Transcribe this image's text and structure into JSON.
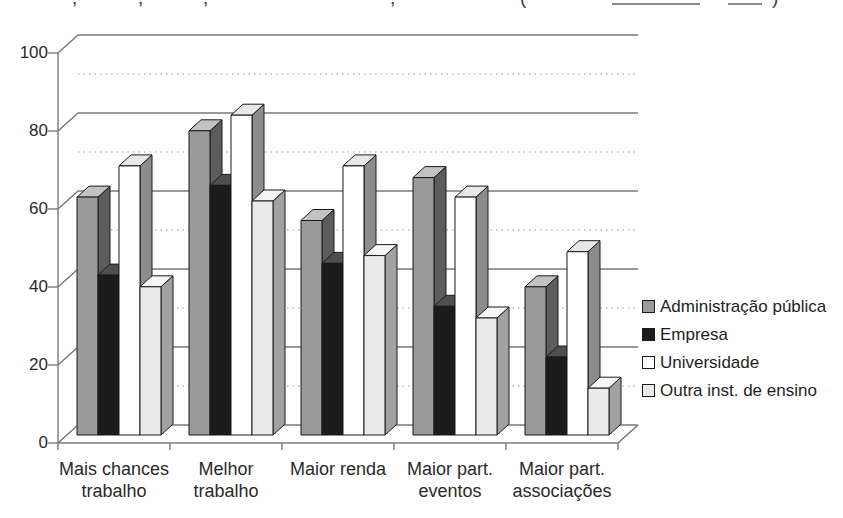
{
  "caption_fragments": {
    "glyphs": [
      {
        "x": 72,
        "ch": ","
      },
      {
        "x": 138,
        "ch": ","
      },
      {
        "x": 203,
        "ch": ","
      },
      {
        "x": 390,
        "ch": ","
      },
      {
        "x": 520,
        "ch": "("
      },
      {
        "x": 772,
        "ch": ")"
      }
    ],
    "rules": [
      {
        "x": 612,
        "w": 88
      },
      {
        "x": 728,
        "w": 34
      }
    ]
  },
  "chart_data": {
    "type": "bar",
    "style": "3d-clustered-column",
    "title": "",
    "xlabel": "",
    "ylabel": "",
    "categories": [
      [
        "Mais chances",
        "trabalho"
      ],
      [
        "Melhor",
        "trabalho"
      ],
      [
        "Maior renda",
        ""
      ],
      [
        "Maior part.",
        "eventos"
      ],
      [
        "Maior part.",
        "associações"
      ]
    ],
    "series": [
      {
        "name": "Administração pública",
        "values": [
          61,
          78,
          55,
          66,
          38
        ],
        "front": "#9a9a9a",
        "top": "#c2c2c2",
        "side": "#5c5c5c"
      },
      {
        "name": "Empresa",
        "values": [
          41,
          64,
          44,
          33,
          20
        ],
        "front": "#1c1c1c",
        "top": "#4f4f4f",
        "side": "#000000"
      },
      {
        "name": "Universidade",
        "values": [
          69,
          82,
          69,
          61,
          47
        ],
        "front": "#fefefe",
        "top": "#e8e8e8",
        "side": "#8c8c8c"
      },
      {
        "name": "Outra inst. de ensino",
        "values": [
          38,
          60,
          46,
          30,
          12
        ],
        "front": "#ebebeb",
        "top": "#f5f5f5",
        "side": "#a2a2a2"
      }
    ],
    "ylim": [
      0,
      100
    ],
    "yticks": [
      0,
      20,
      40,
      60,
      80,
      100
    ],
    "minor_gridlines": [
      10,
      30,
      50,
      70,
      90
    ],
    "grid": {
      "major": "solid",
      "minor": "dotted"
    },
    "legend_position": "right"
  },
  "colors": {
    "background": "#ffffff",
    "axis": "#7a7a7a",
    "minor_grid": "#bcbcbc",
    "bar_outline": "#1a1a1a",
    "text": "#2a2a2a"
  }
}
